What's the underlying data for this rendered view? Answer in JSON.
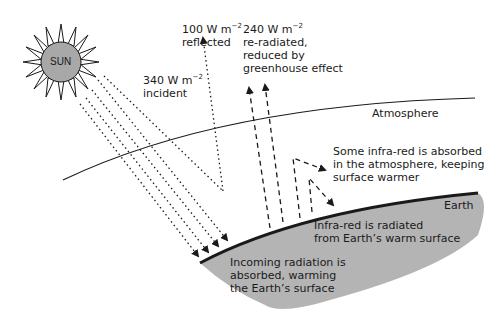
{
  "sun": {
    "label": "SUN",
    "fill": "#a8a8a8"
  },
  "labels": {
    "incident": {
      "line1": "340 W m",
      "exp": "−2",
      "line2": "incident"
    },
    "reflected": {
      "line1": "100 W m",
      "exp": "−2",
      "line2": "reflected"
    },
    "reradiated": {
      "line1": "240 W m",
      "exp": "−2",
      "line2": "re-radiated,",
      "line3": "reduced by",
      "line4": "greenhouse effect"
    },
    "atmosphere": "Atmosphere",
    "absorbed_atmosphere": {
      "line1": "Some infra-red is absorbed",
      "line2": "in the atmosphere, keeping",
      "line3": "surface warmer"
    },
    "earth": "Earth",
    "infrared": {
      "line1": "Infra-red is radiated",
      "line2": "from Earth’s warm surface"
    },
    "incoming": {
      "line1": "Incoming radiation is",
      "line2": "absorbed, warming",
      "line3": "the Earth’s surface"
    }
  },
  "colors": {
    "earth_fill": "#b4b4b4",
    "line": "#1a1a1a"
  }
}
